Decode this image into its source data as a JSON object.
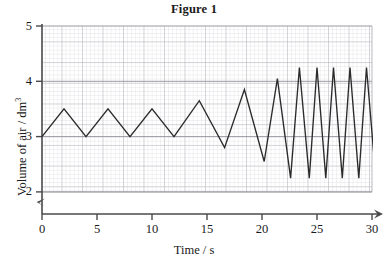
{
  "figure": {
    "title": "Figure 1"
  },
  "axes": {
    "x_title": "Time / s",
    "y_title_main": "Volume of air / dm",
    "y_title_sup": "3",
    "x_ticks": [
      "0",
      "5",
      "10",
      "15",
      "20",
      "25",
      "30"
    ],
    "y_ticks": [
      "5",
      "4",
      "3",
      "2"
    ]
  },
  "colors": {
    "line": "#2b2b2b",
    "axis": "#4a4a4a",
    "grid_minor": "#d9d9dd",
    "grid_major": "#a8a8ae",
    "text": "#1a1a1a"
  },
  "chart_data": {
    "type": "line",
    "title": "Figure 1",
    "xlabel": "Time / s",
    "ylabel": "Volume of air / dm3",
    "xlim": [
      0,
      30
    ],
    "ylim": [
      2,
      5
    ],
    "grid": true,
    "legend": null,
    "x_tick_values": [
      0,
      5,
      10,
      15,
      20,
      25,
      30
    ],
    "y_tick_values": [
      2,
      3,
      4,
      5
    ],
    "x_minor_step": 0.5,
    "y_minor_step": 0.1,
    "axis_break_y": true,
    "series": [
      {
        "name": "Volume of air",
        "points": [
          [
            0.0,
            3.0
          ],
          [
            2.0,
            3.5
          ],
          [
            4.0,
            3.0
          ],
          [
            6.0,
            3.5
          ],
          [
            8.0,
            3.0
          ],
          [
            10.0,
            3.5
          ],
          [
            12.0,
            3.0
          ],
          [
            14.3,
            3.65
          ],
          [
            16.6,
            2.8
          ],
          [
            18.4,
            3.85
          ],
          [
            20.2,
            2.55
          ],
          [
            21.4,
            4.05
          ],
          [
            22.6,
            2.25
          ],
          [
            23.4,
            4.25
          ],
          [
            24.3,
            2.25
          ],
          [
            25.0,
            4.25
          ],
          [
            25.8,
            2.25
          ],
          [
            26.5,
            4.25
          ],
          [
            27.3,
            2.25
          ],
          [
            28.0,
            4.25
          ],
          [
            28.8,
            2.25
          ],
          [
            29.5,
            4.25
          ],
          [
            30.3,
            2.35
          ]
        ]
      }
    ]
  }
}
